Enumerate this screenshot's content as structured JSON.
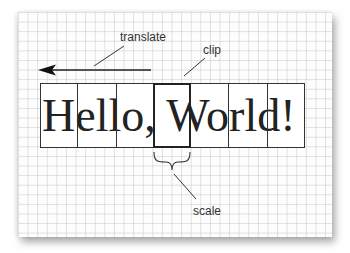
{
  "diagram": {
    "main_text": "Hello, World!",
    "labels": {
      "translate": "translate",
      "clip": "clip",
      "scale": "scale"
    },
    "cells": [
      {
        "x": 40,
        "w": 37
      },
      {
        "x": 77,
        "w": 39
      },
      {
        "x": 116,
        "w": 37
      },
      {
        "x": 153,
        "w": 37,
        "clip": true
      },
      {
        "x": 190,
        "w": 38
      },
      {
        "x": 228,
        "w": 39
      },
      {
        "x": 267,
        "w": 38
      }
    ],
    "colors": {
      "ink": "#222222",
      "grid": "#c8c8c8",
      "label": "#333333"
    }
  }
}
